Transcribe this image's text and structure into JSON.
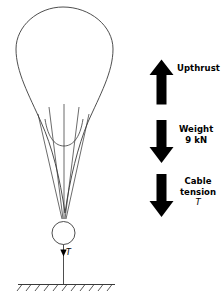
{
  "figure": {
    "type": "free-body-diagram",
    "colors": {
      "stroke": "#3a3a3a",
      "arrow": "#000000",
      "text": "#000000",
      "background": "#ffffff"
    }
  },
  "forces": [
    {
      "id": "upthrust",
      "label": "Upthrust",
      "direction": "up",
      "value": "",
      "symbol": ""
    },
    {
      "id": "weight",
      "label": "Weight",
      "direction": "down",
      "value": "9 kN",
      "symbol": ""
    },
    {
      "id": "cable-tension",
      "label_line1": "Cable",
      "label_line2": "tension",
      "direction": "down",
      "symbol": "T"
    }
  ],
  "annotations": {
    "cable_force_symbol": "T"
  },
  "caption": ""
}
